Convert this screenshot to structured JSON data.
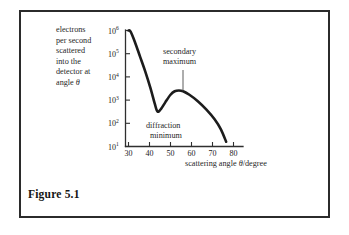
{
  "figure": {
    "caption": "Figure 5.1",
    "frame_color": "#2b2b2b",
    "background": "#ffffff"
  },
  "axis_captions": {
    "y_text_line1": "electrons",
    "y_text_line2": "per second",
    "y_text_line3": "scattered",
    "y_text_line4": "into the",
    "y_text_line5": "detector at",
    "y_text_line6_prefix": "angle ",
    "y_text_line6_symbol": "θ",
    "x_text_prefix": "scattering angle ",
    "x_text_symbol": "θ",
    "x_text_suffix": "/degree"
  },
  "annotations": {
    "secondary_maximum_line1": "secondary",
    "secondary_maximum_line2": "maximum",
    "diffraction_minimum_line1": "diffraction",
    "diffraction_minimum_line2": "minimum"
  },
  "chart_data": {
    "type": "line",
    "title": "Figure 5.1",
    "xlabel": "scattering angle θ/degree",
    "ylabel": "electrons per second scattered into the detector at angle θ",
    "x_ticks": [
      30,
      40,
      50,
      60,
      70,
      80
    ],
    "x_tick_labels": [
      "30",
      "40",
      "50",
      "60",
      "70",
      "80"
    ],
    "xlim": [
      28,
      82
    ],
    "y_ticks": [
      10,
      100,
      1000,
      10000,
      100000,
      1000000
    ],
    "y_tick_labels": [
      "10¹",
      "10²",
      "10³",
      "10⁴",
      "10⁵",
      "10⁶"
    ],
    "y_tick_bases": [
      "10",
      "10",
      "10",
      "10",
      "10",
      "10"
    ],
    "y_tick_exponents": [
      "1",
      "2",
      "3",
      "4",
      "5",
      "6"
    ],
    "ylim": [
      10,
      1000000
    ],
    "yscale": "log",
    "grid": false,
    "legend": null,
    "series": [
      {
        "name": "electron scattering intensity",
        "x": [
          30.0,
          31.0,
          33.0,
          35.5,
          38.0,
          40.5,
          42.5,
          43.8,
          45.5,
          47.5,
          50.0,
          52.0,
          54.0,
          56.0,
          59.0,
          63.0,
          67.0,
          71.0,
          74.0,
          76.5
        ],
        "y": [
          1000000,
          900000,
          330000,
          75000,
          17000,
          3200,
          700,
          320,
          420,
          800,
          1700,
          2400,
          2600,
          2400,
          1700,
          900,
          400,
          150,
          55,
          16
        ]
      }
    ],
    "annotations": [
      {
        "text": "secondary maximum",
        "points_to_x": 54.0,
        "points_to_y": 2600
      },
      {
        "text": "diffraction minimum",
        "points_to_x": 44.0,
        "points_to_y": 320
      }
    ]
  }
}
